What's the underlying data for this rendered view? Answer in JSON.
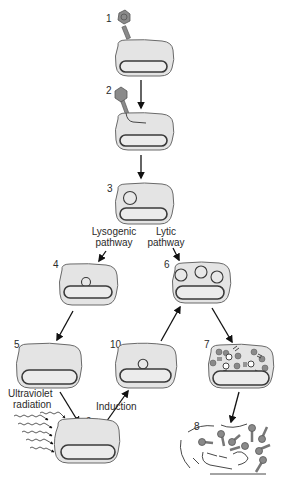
{
  "diagram": {
    "stage_numbers": [
      "1",
      "2",
      "3",
      "4",
      "5",
      "6",
      "7",
      "8",
      "9",
      "10"
    ],
    "labels": {
      "lysogenic_line1": "Lysogenic",
      "lysogenic_line2": "pathway",
      "lytic_line1": "Lytic",
      "lytic_line2": "pathway",
      "uv_line1": "Ultraviolet",
      "uv_line2": "radiation",
      "induction": "Induction"
    },
    "stages": [
      {
        "number": "1",
        "description": "Phage attaches to bacterial cell"
      },
      {
        "number": "2",
        "description": "Phage injects DNA into cell"
      },
      {
        "number": "3",
        "description": "Phage DNA circularizes in cell"
      },
      {
        "number": "4",
        "description": "Phage DNA integrates into bacterial chromosome (lysogenic)"
      },
      {
        "number": "5",
        "description": "Prophage replicated with host chromosome"
      },
      {
        "number": "6",
        "description": "Phage DNA replicates (lytic)"
      },
      {
        "number": "7",
        "description": "New phage particles assembled"
      },
      {
        "number": "8",
        "description": "Cell lyses, releasing phages"
      },
      {
        "number": "9",
        "description": "Cell exposed to ultraviolet radiation"
      },
      {
        "number": "10",
        "description": "Prophage excised from chromosome"
      }
    ],
    "colors": {
      "cell_fill": "#e4e4e4",
      "outline": "#3a3a3a",
      "phage": "#8a8a8a",
      "background": "#ffffff"
    }
  }
}
